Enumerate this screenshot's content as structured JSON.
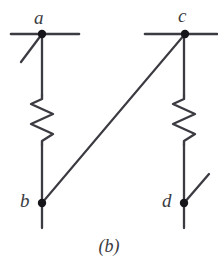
{
  "figure": {
    "caption": "(b)",
    "type": "circuit-schematic",
    "background_color": "#ffffff",
    "stroke_color": "#3b3b42",
    "label_color": "#3b3b42"
  },
  "nodes": [
    {
      "id": "a",
      "label": "a",
      "x": 42,
      "y": 34,
      "dot_radius": 4.2
    },
    {
      "id": "c",
      "label": "c",
      "x": 185,
      "y": 34,
      "dot_radius": 4.2
    },
    {
      "id": "b",
      "label": "b",
      "x": 42,
      "y": 203,
      "dot_radius": 4.2
    },
    {
      "id": "d",
      "label": "d",
      "x": 184,
      "y": 203,
      "dot_radius": 4.2
    }
  ],
  "rails": [
    {
      "name": "top-rail-left",
      "x1": 11,
      "y1": 34,
      "x2": 79,
      "y2": 34
    },
    {
      "name": "top-rail-right",
      "x1": 145,
      "y1": 34,
      "x2": 217,
      "y2": 34
    }
  ],
  "switch_arms": [
    {
      "name": "switch-arm-a",
      "x1": 42,
      "y1": 34,
      "x2": 21,
      "y2": 62
    },
    {
      "name": "switch-arm-d",
      "x1": 184,
      "y1": 203,
      "x2": 209,
      "y2": 174
    }
  ],
  "wires": [
    {
      "name": "wire-a-to-resistor-left",
      "x1": 42,
      "y1": 34,
      "x2": 42,
      "y2": 95
    },
    {
      "name": "wire-resistor-left-to-b",
      "x1": 42,
      "y1": 145,
      "x2": 42,
      "y2": 203
    },
    {
      "name": "wire-b-stub-down",
      "x1": 42,
      "y1": 203,
      "x2": 42,
      "y2": 228
    },
    {
      "name": "wire-c-to-resistor-right",
      "x1": 184,
      "y1": 34,
      "x2": 184,
      "y2": 95
    },
    {
      "name": "wire-resistor-right-to-d",
      "x1": 184,
      "y1": 145,
      "x2": 184,
      "y2": 203
    },
    {
      "name": "wire-d-stub-down",
      "x1": 184,
      "y1": 203,
      "x2": 184,
      "y2": 228
    },
    {
      "name": "wire-b-to-c-diagonal",
      "x1": 42,
      "y1": 203,
      "x2": 185,
      "y2": 34
    }
  ],
  "resistors": [
    {
      "name": "resistor-left",
      "x": 42,
      "y_top": 95,
      "y_bottom": 145,
      "amplitude": 11,
      "zigs": 5
    },
    {
      "name": "resistor-right",
      "x": 184,
      "y_top": 95,
      "y_bottom": 145,
      "amplitude": 11,
      "zigs": 5
    }
  ]
}
